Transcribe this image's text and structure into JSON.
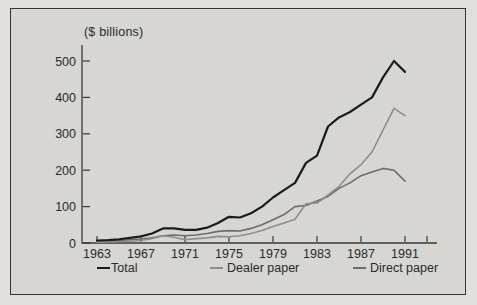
{
  "figure": {
    "background_color": "#d7d6d2",
    "frame_border_color": "#35342f"
  },
  "chart_data": {
    "type": "line",
    "title": "",
    "unit_label": "($ billions)",
    "xlabel": "",
    "ylabel": "($ billions)",
    "ylim": [
      0,
      500
    ],
    "y_ticks": [
      0,
      100,
      200,
      300,
      400,
      500
    ],
    "x_tick_labels": [
      "1963",
      "1967",
      "1971",
      "1975",
      "1979",
      "1983",
      "1987",
      "1991"
    ],
    "grid": false,
    "legend_position": "bottom",
    "x": [
      1963,
      1964,
      1965,
      1966,
      1967,
      1968,
      1969,
      1970,
      1971,
      1972,
      1973,
      1974,
      1975,
      1976,
      1977,
      1978,
      1979,
      1980,
      1981,
      1982,
      1983,
      1984,
      1985,
      1986,
      1987,
      1988,
      1989,
      1990,
      1991
    ],
    "series": [
      {
        "name": "Total",
        "color": "#1b1b19",
        "values": [
          7,
          8,
          10,
          14,
          18,
          26,
          40,
          40,
          36,
          36,
          42,
          55,
          72,
          70,
          82,
          100,
          125,
          145,
          165,
          220,
          240,
          320,
          345,
          360,
          380,
          400,
          455,
          500,
          470
        ]
      },
      {
        "name": "Dealer paper",
        "color": "#8e8d89",
        "values": [
          2,
          3,
          4,
          5,
          7,
          12,
          20,
          16,
          9,
          12,
          14,
          18,
          17,
          20,
          26,
          34,
          45,
          55,
          65,
          108,
          110,
          132,
          155,
          190,
          215,
          250,
          310,
          370,
          350
        ]
      },
      {
        "name": "Direct paper",
        "color": "#6e6c66",
        "values": [
          4,
          5,
          6,
          9,
          11,
          14,
          20,
          22,
          20,
          22,
          26,
          32,
          34,
          33,
          40,
          50,
          64,
          78,
          100,
          103,
          115,
          128,
          150,
          165,
          185,
          195,
          205,
          200,
          170
        ]
      }
    ]
  },
  "axis": {
    "color": "#3a3935",
    "tick_color": "#3a3935"
  }
}
